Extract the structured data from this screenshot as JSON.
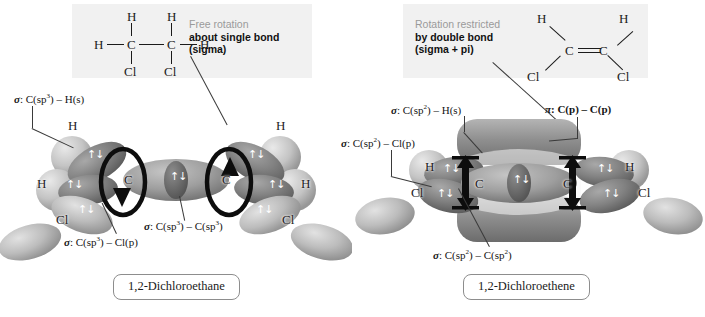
{
  "figure": {
    "colors": {
      "band_background": "#f1f1f1",
      "callout_muted": "#9a9a9a",
      "callout_emphasis": "#111111",
      "rotation_arrow": "#101010",
      "orbital_light": "#c9c9c9",
      "orbital_mid": "#9a9a9a",
      "orbital_dark": "#6f6f6f",
      "caption_border": "#8d8d8d"
    }
  },
  "left_panel": {
    "caption": "1,2-Dichloroethane",
    "callout": {
      "line1": "Free rotation",
      "line2": "about single bond",
      "line3": "(sigma)"
    },
    "lewis": {
      "name": "1,2-dichloroethane-skeletal",
      "atoms": [
        {
          "label": "H",
          "x": 55,
          "y": 2
        },
        {
          "label": "H",
          "x": 97,
          "y": 2
        },
        {
          "label": "H",
          "x": 13,
          "y": 31
        },
        {
          "label": "C",
          "x": 55,
          "y": 31
        },
        {
          "label": "C",
          "x": 97,
          "y": 31
        },
        {
          "label": "H",
          "x": 139,
          "y": 31
        },
        {
          "label": "Cl",
          "x": 52,
          "y": 58
        },
        {
          "label": "Cl",
          "x": 94,
          "y": 58
        }
      ]
    },
    "orbital_labels": [
      {
        "id": "sigma-c-h",
        "sym": "σ",
        "text": ": C(sp",
        "sup": "3",
        "tail": ") – H(s)"
      },
      {
        "id": "sigma-c-c",
        "sym": "σ",
        "text": ": C(sp",
        "sup": "3",
        "tail": ") – C(sp",
        "sup2": "3",
        "tail2": ")"
      },
      {
        "id": "sigma-c-cl",
        "sym": "σ",
        "text": ": C(sp",
        "sup": "3",
        "tail": ") – Cl(p)"
      }
    ],
    "atom_labels": [
      "H",
      "H",
      "C",
      "C",
      "H",
      "H",
      "Cl",
      "Cl"
    ],
    "rotation": "free"
  },
  "right_panel": {
    "caption": "1,2-Dichloroethene",
    "callout": {
      "line1": "Rotation restricted",
      "line2": "by double bond",
      "line3": "(sigma + pi)"
    },
    "lewis": {
      "name": "1,2-dichloroethene-skeletal",
      "atoms": [
        {
          "label": "H",
          "x": 18,
          "y": 2
        },
        {
          "label": "H",
          "x": 108,
          "y": 2
        },
        {
          "label": "C",
          "x": 46,
          "y": 33
        },
        {
          "label": "C",
          "x": 82,
          "y": 33
        },
        {
          "label": "Cl",
          "x": 6,
          "y": 60
        },
        {
          "label": "Cl",
          "x": 102,
          "y": 60
        }
      ]
    },
    "orbital_labels": [
      {
        "id": "sigma-c-h",
        "sym": "σ",
        "text": ": C(sp",
        "sup": "2",
        "tail": ") – H(s)"
      },
      {
        "id": "sigma-c-cl",
        "sym": "σ",
        "text": ": C(sp",
        "sup": "2",
        "tail": ") – Cl(p)"
      },
      {
        "id": "pi-c-c",
        "sym": "π",
        "text": ": C(p) – C(p)",
        "bold": true
      },
      {
        "id": "sigma-c-c",
        "sym": "σ",
        "text": ": C(sp",
        "sup": "2",
        "tail": ") – C(sp",
        "sup2": "2",
        "tail2": ")"
      }
    ],
    "atom_labels": [
      "H",
      "H",
      "C",
      "C",
      "Cl",
      "Cl"
    ],
    "rotation": "restricted"
  }
}
